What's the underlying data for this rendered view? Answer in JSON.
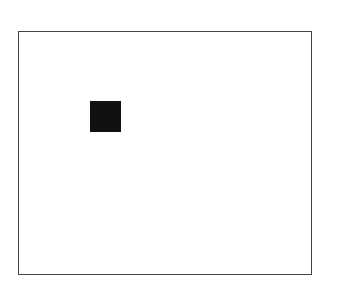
{
  "diagram": {
    "frame": {
      "border_color": "#444444",
      "fill": "#ffffff"
    },
    "square": {
      "fill": "#111111"
    }
  }
}
